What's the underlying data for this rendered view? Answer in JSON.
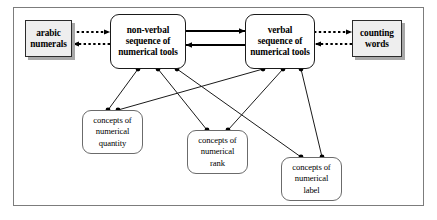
{
  "diagram": {
    "type": "flow-diagram",
    "frame": {
      "visible": true,
      "border_color": "#7c7c7c"
    },
    "nodes": [
      {
        "id": "arabic-numerals",
        "shape": "rectangle-shadow",
        "lines": [
          "arabic",
          "numerals"
        ],
        "fill": "#eeeeee",
        "stroke": "#2b2b2b"
      },
      {
        "id": "non-verbal-sequence",
        "shape": "rounded-rectangle",
        "lines": [
          "non-verbal",
          "sequence of",
          "numerical tools"
        ],
        "fill": "#ffffff",
        "stroke": "#1a1a1a"
      },
      {
        "id": "verbal-sequence",
        "shape": "rounded-rectangle",
        "lines": [
          "verbal",
          "sequence of",
          "numerical tools"
        ],
        "fill": "#ffffff",
        "stroke": "#1a1a1a"
      },
      {
        "id": "counting-words",
        "shape": "rectangle-shadow",
        "lines": [
          "counting",
          "words"
        ],
        "fill": "#eeeeee",
        "stroke": "#2b2b2b"
      },
      {
        "id": "concepts-numerical-quantity",
        "shape": "rounded-rectangle",
        "lines": [
          "concepts of",
          "numerical",
          "quantity"
        ],
        "fill": "#ffffff",
        "stroke": "#6b6b6b"
      },
      {
        "id": "concepts-numerical-rank",
        "shape": "rounded-rectangle",
        "lines": [
          "concepts of",
          "numerical",
          "rank"
        ],
        "fill": "#ffffff",
        "stroke": "#6b6b6b"
      },
      {
        "id": "concepts-numerical-label",
        "shape": "rounded-rectangle",
        "lines": [
          "concepts of",
          "numerical",
          "label"
        ],
        "fill": "#ffffff",
        "stroke": "#6b6b6b"
      }
    ],
    "edges": [
      {
        "id": "arabic-to-nonverbal",
        "from": "arabic-numerals",
        "to": "non-verbal-sequence",
        "style": "dotted",
        "arrow": "end"
      },
      {
        "id": "nonverbal-to-arabic",
        "from": "non-verbal-sequence",
        "to": "arabic-numerals",
        "style": "dotted",
        "arrow": "end"
      },
      {
        "id": "nonverbal-to-verbal",
        "from": "non-verbal-sequence",
        "to": "verbal-sequence",
        "style": "solid",
        "arrow": "end"
      },
      {
        "id": "verbal-to-nonverbal",
        "from": "verbal-sequence",
        "to": "non-verbal-sequence",
        "style": "solid",
        "arrow": "end"
      },
      {
        "id": "verbal-to-counting",
        "from": "verbal-sequence",
        "to": "counting-words",
        "style": "dotted",
        "arrow": "end"
      },
      {
        "id": "counting-to-verbal",
        "from": "counting-words",
        "to": "verbal-sequence",
        "style": "dotted",
        "arrow": "end"
      },
      {
        "id": "nonverbal-to-quantity",
        "from": "non-verbal-sequence",
        "to": "concepts-numerical-quantity",
        "style": "solid",
        "arrow": "none",
        "endpoints": "dot-dot"
      },
      {
        "id": "nonverbal-to-rank",
        "from": "non-verbal-sequence",
        "to": "concepts-numerical-rank",
        "style": "solid",
        "arrow": "none",
        "endpoints": "dot-dot"
      },
      {
        "id": "nonverbal-to-label",
        "from": "non-verbal-sequence",
        "to": "concepts-numerical-label",
        "style": "solid",
        "arrow": "none",
        "endpoints": "dot-dot"
      },
      {
        "id": "verbal-to-quantity",
        "from": "verbal-sequence",
        "to": "concepts-numerical-quantity",
        "style": "solid",
        "arrow": "none",
        "endpoints": "dot-dot"
      },
      {
        "id": "verbal-to-rank",
        "from": "verbal-sequence",
        "to": "concepts-numerical-rank",
        "style": "solid",
        "arrow": "none",
        "endpoints": "dot-dot"
      },
      {
        "id": "verbal-to-label",
        "from": "verbal-sequence",
        "to": "concepts-numerical-label",
        "style": "solid",
        "arrow": "none",
        "endpoints": "dot-dot"
      }
    ]
  }
}
